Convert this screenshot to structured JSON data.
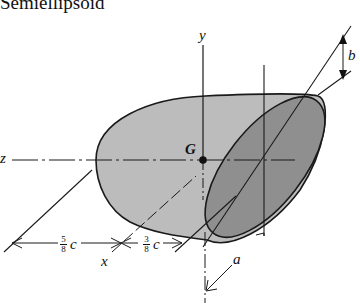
{
  "figure": {
    "title": "Semiellipsoid",
    "labels": {
      "y_axis": "y",
      "z_axis": "z",
      "x_axis": "x",
      "centroid": "G",
      "dim_a": "a",
      "dim_b": "b",
      "dim_c_sym": "c"
    },
    "dimensions": [
      {
        "numerator": "5",
        "denominator": "8",
        "symbol": "c"
      },
      {
        "numerator": "3",
        "denominator": "8",
        "symbol": "c"
      }
    ],
    "colors": {
      "body_fill": "#b9b9b9",
      "face_fill": "#8e8e8e",
      "line": "#1a1a1a"
    }
  }
}
